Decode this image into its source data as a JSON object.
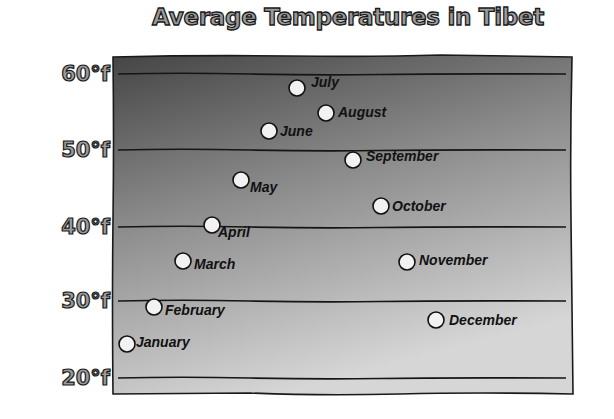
{
  "chart_data": {
    "type": "scatter",
    "title": "Average Temperatures in Tibet",
    "xlabel": "",
    "ylabel": "",
    "ylim": [
      20,
      60
    ],
    "yticks": [
      "20°f",
      "30°f",
      "40°f",
      "50°f",
      "60°f"
    ],
    "grid": true,
    "legend": "none",
    "categories": [
      "January",
      "February",
      "March",
      "April",
      "May",
      "June",
      "July",
      "August",
      "September",
      "October",
      "November",
      "December"
    ],
    "values": [
      24.5,
      29,
      35,
      40,
      46,
      52.5,
      58,
      55,
      49,
      42.5,
      35,
      27.5
    ],
    "colors": {
      "background_top": "#4a4a4a",
      "background_bottom": "#d2d2d2",
      "marker": "#f2f2f2"
    }
  },
  "title": "Average Temperatures in Tibet",
  "yaxis": {
    "ticks": [
      {
        "label": "60°f",
        "y": 74
      },
      {
        "label": "50°f",
        "y": 150
      },
      {
        "label": "40°f",
        "y": 227
      },
      {
        "label": "30°f",
        "y": 301
      },
      {
        "label": "20°f",
        "y": 378
      }
    ]
  },
  "points": [
    {
      "label": "January",
      "cx": 127,
      "cy": 344,
      "lx": 136,
      "ly": 342
    },
    {
      "label": "February",
      "cx": 154,
      "cy": 307,
      "lx": 165,
      "ly": 310
    },
    {
      "label": "March",
      "cx": 183,
      "cy": 261,
      "lx": 194,
      "ly": 264
    },
    {
      "label": "April",
      "cx": 212,
      "cy": 225,
      "lx": 218,
      "ly": 232
    },
    {
      "label": "May",
      "cx": 241,
      "cy": 180,
      "lx": 250,
      "ly": 187
    },
    {
      "label": "June",
      "cx": 269,
      "cy": 131,
      "lx": 280,
      "ly": 131
    },
    {
      "label": "July",
      "cx": 297,
      "cy": 88,
      "lx": 311,
      "ly": 82
    },
    {
      "label": "August",
      "cx": 326,
      "cy": 113,
      "lx": 338,
      "ly": 112
    },
    {
      "label": "September",
      "cx": 353,
      "cy": 160,
      "lx": 366,
      "ly": 156
    },
    {
      "label": "October",
      "cx": 381,
      "cy": 206,
      "lx": 392,
      "ly": 206
    },
    {
      "label": "November",
      "cx": 407,
      "cy": 262,
      "lx": 419,
      "ly": 260
    },
    {
      "label": "December",
      "cx": 436,
      "cy": 320,
      "lx": 449,
      "ly": 320
    }
  ]
}
